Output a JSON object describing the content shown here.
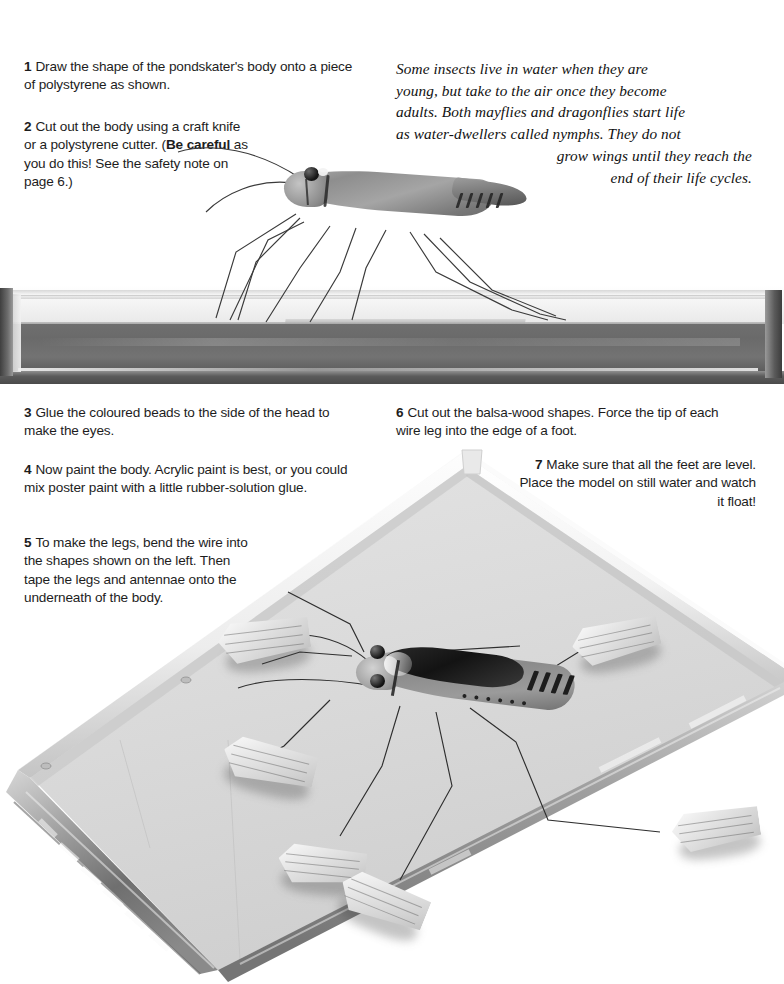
{
  "page": {
    "background": "#ffffff"
  },
  "steps": [
    {
      "number": "1",
      "text": "Draw the shape of the pondskater's body onto a piece of polystyrene as shown."
    },
    {
      "number": "2",
      "text_before": "Cut out the body using a craft knife or a polystyrene cutter. (",
      "bold": "Be careful",
      "text_after": " as you do this! See the safety note on page 6.)"
    },
    {
      "number": "3",
      "text": "Glue the coloured beads to the side of the head to make the eyes."
    },
    {
      "number": "4",
      "text": "Now paint the body. Acrylic paint is best, or you could mix poster paint with a little rubber-solution glue."
    },
    {
      "number": "5",
      "text": "To make the legs, bend the wire into the shapes shown on the left. Then tape the legs and antennae onto the underneath of the body."
    },
    {
      "number": "6",
      "text": "Cut out the balsa-wood shapes. Force the tip of each wire leg into the edge of a foot."
    },
    {
      "number": "7",
      "text": "Make sure that all the feet are level. Place the model on still water and watch it float!"
    }
  ],
  "caption": {
    "lines": [
      "Some insects live in water when they are",
      "young, but take to the air once they become",
      "adults. Both mayflies and dragonflies start life",
      "as water-dwellers called nymphs. They do not",
      "grow wings until they reach the",
      "end of their life cycles."
    ]
  },
  "figures": {
    "tank_side": {
      "name": "glass water tank, side view",
      "water_color": "#6f6f6f",
      "glass_color": "#f2f2f2",
      "base_color": "#4a4a4a"
    },
    "tank_top": {
      "name": "glass water tank, perspective view",
      "water_color": "#dcdcdc",
      "frame_color": "#cfcfcf"
    },
    "model_side": {
      "name": "pondskater model standing on water, side view",
      "body_color": "#8e8e8e",
      "eye_color": "#161616",
      "leg_count": 6,
      "antennae_count": 2
    },
    "model_top": {
      "name": "pondskater model floating, view from above",
      "body_color": "#8b8b8b",
      "wing_patch_color": "#131313",
      "eye_color": "#121212",
      "balsa_feet_count": 6
    }
  },
  "colors": {
    "text": "#1d1d1d",
    "paper": "#ffffff",
    "water_dark": "#6f6f6f",
    "water_light": "#dcdcdc"
  }
}
